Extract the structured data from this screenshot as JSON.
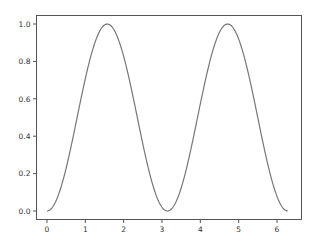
{
  "chart_data": {
    "type": "line",
    "title": "",
    "xlabel": "",
    "ylabel": "",
    "function": "sin(x)^2",
    "xlim": [
      -0.31,
      6.6
    ],
    "ylim": [
      -0.05,
      1.05
    ],
    "grid": false,
    "legend": null,
    "xticks": [
      0,
      1,
      2,
      3,
      4,
      5,
      6
    ],
    "xtick_labels": [
      "0",
      "1",
      "2",
      "3",
      "4",
      "5",
      "6"
    ],
    "yticks": [
      0.0,
      0.2,
      0.4,
      0.6,
      0.8,
      1.0
    ],
    "ytick_labels": [
      "0.0",
      "0.2",
      "0.4",
      "0.6",
      "0.8",
      "1.0"
    ],
    "series": [
      {
        "name": "sin^2(x)",
        "color": "#777777",
        "x": [
          0.0,
          0.2618,
          0.5236,
          0.7854,
          1.0472,
          1.309,
          1.5708,
          1.8326,
          2.0944,
          2.3562,
          2.618,
          2.8798,
          3.1416,
          3.4034,
          3.6652,
          3.927,
          4.1888,
          4.4506,
          4.7124,
          4.9742,
          5.236,
          5.4978,
          5.7596,
          6.0214,
          6.2832
        ],
        "values": [
          0.0,
          0.067,
          0.25,
          0.5,
          0.75,
          0.933,
          1.0,
          0.933,
          0.75,
          0.5,
          0.25,
          0.067,
          0.0,
          0.067,
          0.25,
          0.5,
          0.75,
          0.933,
          1.0,
          0.933,
          0.75,
          0.5,
          0.25,
          0.067,
          0.0
        ]
      }
    ]
  },
  "style": {
    "axis_color": "#555555",
    "line_color": "#777777",
    "background": "#ffffff"
  }
}
